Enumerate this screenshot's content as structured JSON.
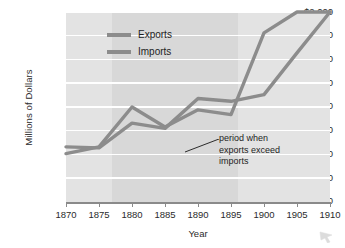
{
  "chart_data": {
    "type": "line",
    "title": "",
    "xlabel": "Year",
    "ylabel": "Millions of Dollars",
    "x": [
      1870,
      1875,
      1880,
      1885,
      1890,
      1895,
      1900,
      1905,
      1910
    ],
    "xlim": [
      1870,
      1910
    ],
    "ylim": [
      0,
      2000
    ],
    "grid": true,
    "legend_position": "upper-left-inside",
    "xtick_labels": [
      "1870",
      "1875",
      "1880",
      "1885",
      "1890",
      "1895",
      "1900",
      "1905",
      "1910"
    ],
    "ytick_values": [
      0,
      250,
      500,
      750,
      1000,
      1250,
      1500,
      1750,
      2000
    ],
    "ytick_labels": [
      "0",
      "250",
      "500",
      "750",
      "1,000",
      "1,250",
      "1,500",
      "1,750",
      "$2,000"
    ],
    "series": [
      {
        "name": "Exports",
        "color": "#8c8c8c",
        "values": [
          510,
          580,
          1000,
          790,
          970,
          920,
          1780,
          2000,
          2000
        ]
      },
      {
        "name": "Imports",
        "color": "#8c8c8c",
        "values": [
          580,
          570,
          830,
          775,
          1090,
          1060,
          1130,
          1570,
          2000
        ]
      }
    ],
    "annotations": [
      {
        "text_lines": [
          "period when",
          "exports exceed",
          "imports"
        ],
        "text": "period when exports exceed imports",
        "highlight_band": {
          "from": 1877,
          "to": 1896
        }
      }
    ],
    "colors": {
      "plot_background": "#e3e3e3",
      "highlight_band": "#d8d8d8",
      "gridline": "#ffffff",
      "axis": "#8a8a8a",
      "line": "#8c8c8c",
      "text": "#2b2b2b",
      "page_background": "#ffffff"
    }
  },
  "legend": {
    "items": [
      {
        "label": "Exports"
      },
      {
        "label": "Imports"
      }
    ]
  },
  "axes": {
    "y_title": "Millions of Dollars",
    "x_title": "Year"
  },
  "annotation": {
    "line1": "period when",
    "line2": "exports exceed",
    "line3": "imports"
  },
  "icons": {
    "corner_cursor": "cursor-arrow-icon"
  }
}
